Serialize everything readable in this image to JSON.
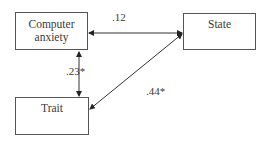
{
  "diagram": {
    "type": "path-diagram",
    "nodes": [
      {
        "id": "computer_anxiety",
        "label_lines": [
          "Computer",
          "anxiety"
        ]
      },
      {
        "id": "state",
        "label_lines": [
          "State"
        ]
      },
      {
        "id": "trait",
        "label_lines": [
          "Trait"
        ]
      }
    ],
    "edges": [
      {
        "from": "computer_anxiety",
        "to": "state",
        "direction": "both",
        "coefficient": ".12"
      },
      {
        "from": "computer_anxiety",
        "to": "trait",
        "direction": "both",
        "coefficient": ".23*"
      },
      {
        "from": "trait",
        "to": "state",
        "direction": "both",
        "coefficient": ".44*"
      }
    ],
    "colors": {
      "line": "#333333",
      "box_border": "#555555",
      "text": "#3a3a3a",
      "background": "#ffffff"
    }
  }
}
